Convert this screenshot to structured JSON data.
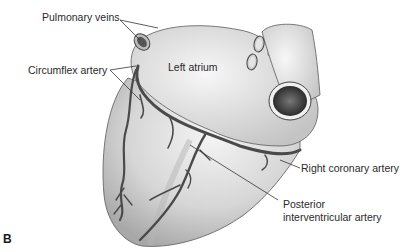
{
  "figure": {
    "panel_letter": "B",
    "labels": {
      "pulmonary_veins": "Pulmonary veins",
      "circumflex_artery": "Circumflex artery",
      "left_atrium": "Left atrium",
      "right_coronary_artery": "Right coronary artery",
      "posterior_interventricular_line1": "Posterior",
      "posterior_interventricular_line2": "interventricular artery"
    },
    "colors": {
      "background": "#ffffff",
      "heart_fill": "#d9d9d9",
      "heart_highlight": "#f2f2f2",
      "vessel": "#4a4a4a",
      "outline": "#5a5a5a",
      "text": "#2a2a2a"
    }
  }
}
